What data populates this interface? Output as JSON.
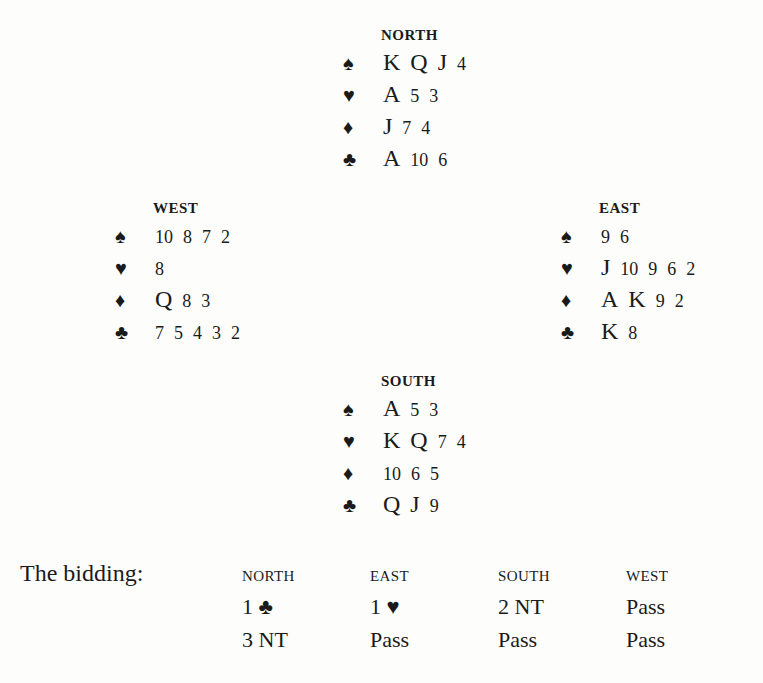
{
  "hands": {
    "north": {
      "label": "NORTH",
      "suits": [
        {
          "suit": "♠",
          "name": "spade",
          "cards": [
            "K",
            "Q",
            "J",
            "4"
          ]
        },
        {
          "suit": "♥",
          "name": "heart",
          "cards": [
            "A",
            "5",
            "3"
          ]
        },
        {
          "suit": "♦",
          "name": "diamond",
          "cards": [
            "J",
            "7",
            "4"
          ]
        },
        {
          "suit": "♣",
          "name": "club",
          "cards": [
            "A",
            "10",
            "6"
          ]
        }
      ]
    },
    "west": {
      "label": "WEST",
      "suits": [
        {
          "suit": "♠",
          "name": "spade",
          "cards": [
            "10",
            "8",
            "7",
            "2"
          ]
        },
        {
          "suit": "♥",
          "name": "heart",
          "cards": [
            "8"
          ]
        },
        {
          "suit": "♦",
          "name": "diamond",
          "cards": [
            "Q",
            "8",
            "3"
          ]
        },
        {
          "suit": "♣",
          "name": "club",
          "cards": [
            "7",
            "5",
            "4",
            "3",
            "2"
          ]
        }
      ]
    },
    "east": {
      "label": "EAST",
      "suits": [
        {
          "suit": "♠",
          "name": "spade",
          "cards": [
            "9",
            "6"
          ]
        },
        {
          "suit": "♥",
          "name": "heart",
          "cards": [
            "J",
            "10",
            "9",
            "6",
            "2"
          ]
        },
        {
          "suit": "♦",
          "name": "diamond",
          "cards": [
            "A",
            "K",
            "9",
            "2"
          ]
        },
        {
          "suit": "♣",
          "name": "club",
          "cards": [
            "K",
            "8"
          ]
        }
      ]
    },
    "south": {
      "label": "SOUTH",
      "suits": [
        {
          "suit": "♠",
          "name": "spade",
          "cards": [
            "A",
            "5",
            "3"
          ]
        },
        {
          "suit": "♥",
          "name": "heart",
          "cards": [
            "K",
            "Q",
            "7",
            "4"
          ]
        },
        {
          "suit": "♦",
          "name": "diamond",
          "cards": [
            "10",
            "6",
            "5"
          ]
        },
        {
          "suit": "♣",
          "name": "club",
          "cards": [
            "Q",
            "J",
            "9"
          ]
        }
      ]
    }
  },
  "bidding": {
    "title": "The bidding:",
    "headers": [
      "NORTH",
      "EAST",
      "SOUTH",
      "WEST"
    ],
    "rounds": [
      [
        "1 ♣",
        "1 ♥",
        "2 NT",
        "Pass"
      ],
      [
        "3 NT",
        "Pass",
        "Pass",
        "Pass"
      ]
    ]
  }
}
